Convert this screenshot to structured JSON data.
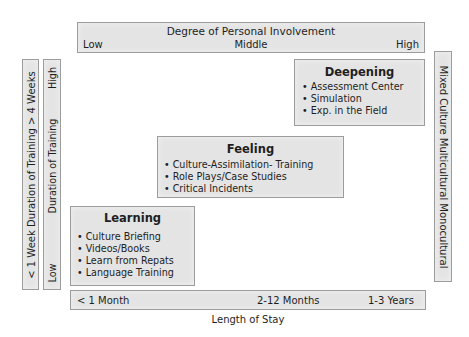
{
  "top_axis": {
    "title": "Degree of Personal Involvement",
    "low": "Low",
    "middle": "Middle",
    "high": "High"
  },
  "bottom_axis": {
    "ticks": [
      "< 1 Month",
      "2-12 Months",
      "1-3 Years"
    ],
    "title": "Length of Stay"
  },
  "left_axis_outer": {
    "label": "< 1 Week Duration of Training > 4 Weeks"
  },
  "left_axis_inner": {
    "low": "Low",
    "title": "Duration of Training",
    "high": "High"
  },
  "right_axis": {
    "label": "Mixed Culture Multicultural Monocultural"
  },
  "boxes": {
    "deepening": {
      "title": "Deepening",
      "items": [
        "Assessment Center",
        "Simulation",
        "Exp. in the Field"
      ]
    },
    "feeling": {
      "title": "Feeling",
      "items": [
        "Culture-Assimilation- Training",
        "Role Plays/Case Studies",
        "Critical Incidents"
      ]
    },
    "learning": {
      "title": "Learning",
      "items": [
        "Culture Briefing",
        "Videos/Books",
        "Learn from Repats",
        "Language Training"
      ]
    }
  },
  "colors": {
    "box_fill": "#e4e4e4",
    "box_border": "#9c9c9c",
    "text": "#1e1e1e"
  }
}
